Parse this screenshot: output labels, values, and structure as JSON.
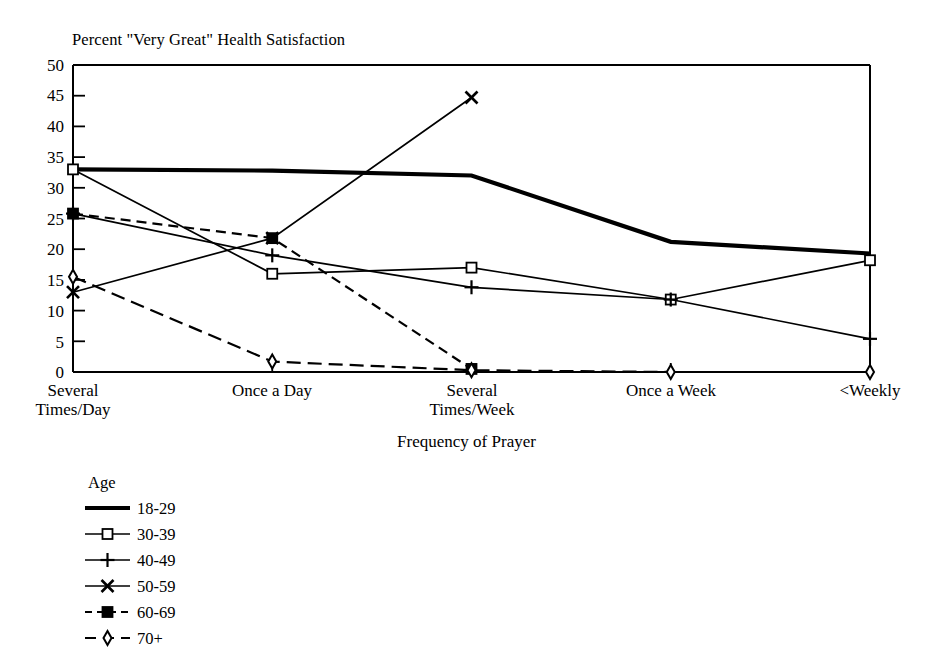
{
  "chart_data": {
    "type": "line",
    "title": "Percent \"Very Great\" Health Satisfaction",
    "xlabel": "Frequency of Prayer",
    "ylabel": "",
    "categories": [
      "Several\nTimes/Day",
      "Once a Day",
      "Several\nTimes/Week",
      "Once a Week",
      "<Weekly"
    ],
    "ylim": [
      0,
      50
    ],
    "ytick_values": [
      0,
      5,
      10,
      15,
      20,
      25,
      30,
      35,
      40,
      45,
      50
    ],
    "ytick_labels": [
      "0",
      "5",
      "10",
      "15",
      "20",
      "25",
      "30",
      "35",
      "40",
      "45",
      "50"
    ],
    "grid": false,
    "legend_position": "below-left",
    "legend_title": "Age",
    "series": [
      {
        "name": "18-29",
        "values": [
          33.0,
          32.8,
          32.0,
          21.2,
          19.3
        ],
        "marker": "none",
        "line": "solid-thick"
      },
      {
        "name": "30-39",
        "values": [
          33.0,
          16.0,
          17.0,
          11.8,
          18.2
        ],
        "marker": "open-square",
        "line": "solid"
      },
      {
        "name": "40-49",
        "values": [
          25.8,
          19.0,
          13.8,
          11.8,
          5.4
        ],
        "marker": "plus",
        "line": "solid"
      },
      {
        "name": "50-59",
        "values": [
          13.0,
          21.8,
          44.7,
          null,
          null
        ],
        "marker": "cross",
        "line": "solid"
      },
      {
        "name": "60-69",
        "values": [
          25.8,
          21.8,
          0.5,
          null,
          null
        ],
        "marker": "filled-square",
        "line": "dashed"
      },
      {
        "name": "70+",
        "values": [
          15.5,
          1.7,
          0.3,
          0.0,
          0.0
        ],
        "marker": "open-diamond",
        "line": "long-dash"
      }
    ]
  },
  "axis": {
    "title": "Percent \"Very Great\" Health Satisfaction",
    "xlabel": "Frequency of Prayer"
  },
  "legend": {
    "title": "Age",
    "entries": [
      {
        "label": "18-29"
      },
      {
        "label": "30-39"
      },
      {
        "label": "40-49"
      },
      {
        "label": "50-59"
      },
      {
        "label": "60-69"
      },
      {
        "label": "70+"
      }
    ]
  },
  "colors": {
    "ink": "#000000",
    "background": "#ffffff"
  }
}
